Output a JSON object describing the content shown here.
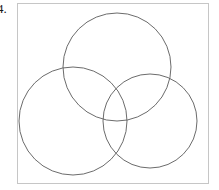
{
  "page": {
    "width": 219,
    "height": 190,
    "background_color": "#ffffff"
  },
  "item_number": {
    "label": "4.",
    "color": "#1a1a1a"
  },
  "figure": {
    "frame": {
      "x": 17,
      "y": 3,
      "width": 192,
      "height": 181,
      "border_color": "#c6c6c6",
      "border_width": 1,
      "fill": "#ffffff"
    },
    "stroke_color": "#5a5a5a",
    "stroke_width": 0.9,
    "fill": "none"
  },
  "chart_data": {
    "type": "diagram",
    "diagram_type": "venn",
    "title": "",
    "subtitle": "",
    "xlabel": "",
    "ylabel": "",
    "set_count": 3,
    "labels": [],
    "legend": [],
    "annotations": [],
    "shapes": [
      {
        "name": "top-circle",
        "shape": "circle",
        "cx": 117,
        "cy": 67,
        "r": 54,
        "stroke": "#5a5a5a",
        "fill": "none"
      },
      {
        "name": "left-circle",
        "shape": "circle",
        "cx": 73,
        "cy": 121,
        "r": 54,
        "stroke": "#5a5a5a",
        "fill": "none"
      },
      {
        "name": "right-circle",
        "shape": "circle",
        "cx": 150,
        "cy": 121,
        "r": 47,
        "stroke": "#5a5a5a",
        "fill": "none"
      }
    ]
  }
}
